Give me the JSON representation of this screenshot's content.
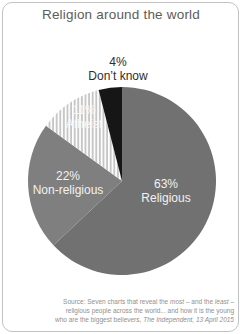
{
  "source": {
    "l1_a": "Source: Seven charts that reveal the ",
    "l1_b": "most",
    "l1_c": " – and the ",
    "l1_d": "least",
    "l1_e": " –",
    "l2": "religious people across the world... and how it is the young",
    "l3_a": "who are the biggest believers, ",
    "l3_b": "The Independent, 13 April 2015"
  },
  "chart_data": {
    "type": "pie",
    "title": "Religion around the world",
    "direction": "clockwise",
    "start_angle_deg": 0,
    "total": 100,
    "center_x": 122,
    "center_y": 181,
    "radius": 94,
    "legend": "none",
    "slices": [
      {
        "label": "Religious",
        "value": 63,
        "pct_label": "63%",
        "color": "#717171",
        "label_color": "#f2f2f2",
        "label_x": 166,
        "label_y": 188
      },
      {
        "label": "Non-religious",
        "value": 22,
        "pct_label": "22%",
        "color": "#7f7f7f",
        "label_color": "#f2f2f2",
        "label_x": 68,
        "label_y": 180
      },
      {
        "label": "Atheist",
        "value": 11,
        "pct_label": "11%",
        "color": "#c6c6c6",
        "pattern": "vertical-white-stripes",
        "label_color": "#f7f7f7",
        "label_x": 84,
        "label_y": 114
      },
      {
        "label": "Don’t know",
        "value": 4,
        "pct_label": "4%",
        "color": "#161616",
        "label_color": "#2e2e2e",
        "label_outside": true,
        "label_x": 118,
        "label_y": 66
      }
    ]
  }
}
